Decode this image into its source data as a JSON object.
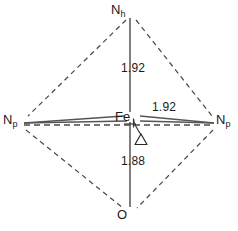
{
  "figure": {
    "type": "molecular-coordination-geometry-diagram",
    "background_color": "#ffffff",
    "line_color": "#3a3a3a",
    "text_color": "#1a1a1a"
  },
  "center_atom": {
    "name": "iron-center",
    "label": "Fe",
    "x": 130,
    "y": 118
  },
  "vertices": [
    {
      "name": "nitrogen-axial-top",
      "element": "N",
      "subscript": "h",
      "position": "top",
      "x": 130,
      "y": 14
    },
    {
      "name": "nitrogen-equatorial-left",
      "element": "N",
      "subscript": "p",
      "position": "left",
      "x": 18,
      "y": 122
    },
    {
      "name": "nitrogen-equatorial-right",
      "element": "N",
      "subscript": "p",
      "position": "right",
      "x": 222,
      "y": 122
    },
    {
      "name": "oxygen-axial-bottom",
      "element": "O",
      "subscript": "",
      "position": "bottom",
      "x": 130,
      "y": 216
    }
  ],
  "bonds": [
    {
      "name": "bond-fe-n-axial-top",
      "from": "Fe",
      "to": "Nh",
      "distance": "1.92",
      "style": "solid",
      "orientation": "vertical-up"
    },
    {
      "name": "bond-fe-n-equatorial-right",
      "from": "Fe",
      "to": "Np",
      "distance": "1.92",
      "style": "solid",
      "orientation": "horizontal-right"
    },
    {
      "name": "bond-fe-o-axial-bottom",
      "from": "Fe",
      "to": "O",
      "distance": "1.88",
      "style": "solid",
      "orientation": "vertical-down"
    }
  ],
  "displacement_marker": {
    "name": "out-of-plane-displacement",
    "symbol": "Δ",
    "x": 141,
    "y": 136,
    "leader_style": "curved"
  },
  "edges": {
    "style": "dashed",
    "description": "dashed outline edges connecting the four outer vertices, plus a dashed equatorial plane line between the two Np vertices"
  }
}
